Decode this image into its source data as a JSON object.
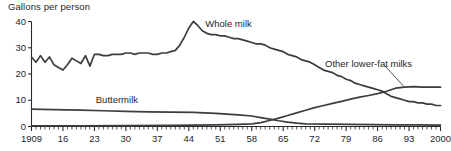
{
  "chart_data": {
    "type": "line",
    "title": "Gallons per person",
    "xlabel": "",
    "ylabel": "Gallons per person",
    "xlim": [
      1909,
      2000
    ],
    "ylim": [
      0,
      40
    ],
    "grid": false,
    "legend_position": "inline-annotations",
    "ytick_labels": [
      "0",
      "10",
      "20",
      "30",
      "40"
    ],
    "ytick_values": [
      0,
      10,
      20,
      30,
      40
    ],
    "xtick_labels": [
      "1909",
      "16",
      "23",
      "30",
      "37",
      "44",
      "51",
      "58",
      "65",
      "72",
      "79",
      "86",
      "93",
      "2000"
    ],
    "xtick_values": [
      1909,
      1916,
      1923,
      1930,
      1937,
      1944,
      1951,
      1958,
      1965,
      1972,
      1979,
      1986,
      1993,
      2000
    ],
    "minor_tick_interval": 1,
    "series": [
      {
        "name": "Whole milk",
        "label": "Whole milk",
        "color": "#3d3d3d",
        "x": [
          1909,
          1910,
          1911,
          1912,
          1913,
          1914,
          1915,
          1916,
          1917,
          1918,
          1919,
          1920,
          1921,
          1922,
          1923,
          1924,
          1925,
          1926,
          1927,
          1928,
          1929,
          1930,
          1931,
          1932,
          1933,
          1934,
          1935,
          1936,
          1937,
          1938,
          1939,
          1940,
          1941,
          1942,
          1943,
          1944,
          1945,
          1946,
          1947,
          1948,
          1949,
          1950,
          1951,
          1952,
          1953,
          1954,
          1955,
          1956,
          1957,
          1958,
          1959,
          1960,
          1961,
          1962,
          1963,
          1964,
          1965,
          1966,
          1967,
          1968,
          1969,
          1970,
          1971,
          1972,
          1973,
          1974,
          1975,
          1976,
          1977,
          1978,
          1979,
          1980,
          1981,
          1982,
          1983,
          1984,
          1985,
          1986,
          1987,
          1988,
          1989,
          1990,
          1991,
          1992,
          1993,
          1994,
          1995,
          1996,
          1997,
          1998,
          1999,
          2000
        ],
        "values": [
          26.5,
          24.5,
          27.0,
          24.5,
          26.5,
          23.5,
          22.5,
          21.5,
          23.5,
          26.0,
          25.0,
          24.0,
          27.0,
          23.0,
          27.5,
          27.5,
          27.0,
          27.0,
          27.5,
          27.5,
          27.5,
          28.0,
          28.0,
          27.5,
          28.0,
          28.0,
          28.0,
          27.5,
          27.5,
          28.0,
          28.0,
          28.5,
          29.0,
          31.0,
          34.0,
          37.5,
          40.0,
          38.5,
          36.5,
          35.5,
          35.0,
          35.0,
          34.5,
          34.5,
          34.0,
          33.5,
          33.5,
          33.0,
          32.5,
          32.0,
          31.5,
          31.5,
          31.0,
          30.0,
          29.5,
          29.0,
          28.5,
          27.5,
          27.0,
          26.5,
          25.5,
          25.0,
          24.5,
          23.5,
          22.5,
          21.5,
          21.0,
          20.5,
          19.5,
          19.0,
          18.0,
          17.5,
          16.5,
          16.0,
          15.5,
          15.0,
          14.5,
          14.0,
          13.5,
          12.5,
          11.5,
          11.0,
          10.5,
          10.0,
          9.5,
          9.5,
          9.0,
          9.0,
          8.5,
          8.5,
          8.0,
          8.0
        ]
      },
      {
        "name": "Other lower-fat milks",
        "label": "Other lower-fat milks",
        "color": "#3d3d3d",
        "x": [
          1909,
          1920,
          1930,
          1940,
          1945,
          1950,
          1955,
          1958,
          1960,
          1962,
          1964,
          1966,
          1968,
          1970,
          1972,
          1974,
          1976,
          1978,
          1980,
          1982,
          1984,
          1986,
          1988,
          1990,
          1992,
          1994,
          1996,
          1998,
          2000
        ],
        "values": [
          0.2,
          0.2,
          0.3,
          0.4,
          0.5,
          0.6,
          0.8,
          1.0,
          1.5,
          2.3,
          3.2,
          4.2,
          5.2,
          6.2,
          7.2,
          8.0,
          8.8,
          9.6,
          10.4,
          11.2,
          11.8,
          12.5,
          13.4,
          14.6,
          15.0,
          15.2,
          15.0,
          15.0,
          15.0
        ]
      },
      {
        "name": "Buttermilk",
        "label": "Buttermilk",
        "color": "#3d3d3d",
        "x": [
          1909,
          1914,
          1920,
          1925,
          1930,
          1935,
          1940,
          1945,
          1950,
          1955,
          1958,
          1960,
          1962,
          1964,
          1966,
          1968,
          1970,
          1975,
          1980,
          1985,
          1990,
          1995,
          2000
        ],
        "values": [
          6.6,
          6.4,
          6.2,
          6.0,
          5.8,
          5.6,
          5.5,
          5.4,
          5.0,
          4.4,
          4.0,
          3.4,
          2.8,
          2.2,
          1.7,
          1.3,
          1.0,
          0.9,
          0.8,
          0.7,
          0.6,
          0.6,
          0.5
        ]
      }
    ],
    "annotations": [
      {
        "text": "Whole milk",
        "x": 1945,
        "y": 39
      },
      {
        "text": "Buttermilk",
        "x": 1928,
        "y": 10
      },
      {
        "text": "Other lower-fat milks",
        "x": 1984,
        "y": 24,
        "leader_to_x": 1992,
        "leader_to_y": 15
      }
    ]
  },
  "labels": {
    "axis_title": "Gallons per person",
    "whole_milk": "Whole milk",
    "buttermilk": "Buttermilk",
    "other_lower_fat": "Other lower-fat milks"
  },
  "caption": ""
}
